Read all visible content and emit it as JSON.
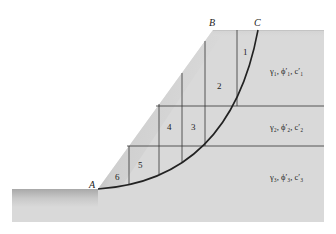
{
  "points": {
    "A": "A",
    "B": "B",
    "C": "C"
  },
  "slices": [
    "1",
    "2",
    "3",
    "4",
    "5",
    "6"
  ],
  "layers": [
    {
      "name": "layer-1",
      "label": "γ₁, ϕ′₁, c′₁"
    },
    {
      "name": "layer-2",
      "label": "γ₂, ϕ′₂, c′₂"
    },
    {
      "name": "layer-3",
      "label": "γ₃, ϕ′₃, c′₃"
    }
  ],
  "colors": {
    "soil": "#d9d9d9",
    "line": "#333333",
    "failure_arc": "#222222",
    "background": "#ffffff"
  }
}
